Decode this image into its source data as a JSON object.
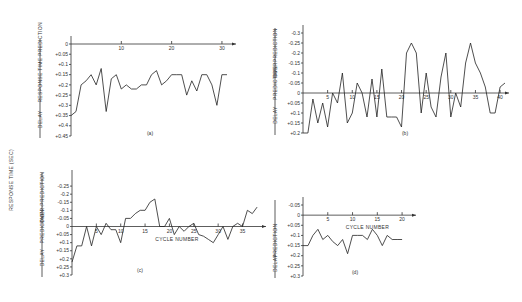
{
  "shared_ylabel": "RESPONSE TIME (SEC)",
  "chart_data": [
    {
      "id": "a",
      "type": "line",
      "caption": "(a)",
      "xlabel": "",
      "ylabel_top": "RESPONSE TIME PREDICTION",
      "ylabel_bottom": "DELAY",
      "xlim": [
        0,
        32
      ],
      "ylim": [
        0,
        0.45
      ],
      "y_inverted": true,
      "x_ticks": [
        10,
        20,
        30
      ],
      "y_ticks": [
        0,
        0.05,
        0.1,
        0.15,
        0.2,
        0.25,
        0.3,
        0.35,
        0.4,
        0.45
      ],
      "y_tick_labels": [
        "0",
        "+0.05",
        "+0.1",
        "+0.15",
        "+0.2",
        "+0.25",
        "+0.3",
        "+0.35",
        "+0.4",
        "+0.45"
      ],
      "x": [
        0,
        1,
        2,
        3,
        4,
        5,
        6,
        7,
        8,
        9,
        10,
        11,
        12,
        13,
        14,
        15,
        16,
        17,
        18,
        19,
        20,
        21,
        22,
        23,
        24,
        25,
        26,
        27,
        28,
        29,
        30,
        31
      ],
      "y": [
        0.35,
        0.33,
        0.2,
        0.18,
        0.15,
        0.2,
        0.12,
        0.33,
        0.17,
        0.15,
        0.22,
        0.2,
        0.22,
        0.22,
        0.2,
        0.2,
        0.15,
        0.13,
        0.2,
        0.18,
        0.15,
        0.15,
        0.15,
        0.25,
        0.18,
        0.23,
        0.15,
        0.15,
        0.2,
        0.3,
        0.15,
        0.15
      ]
    },
    {
      "id": "b",
      "type": "line",
      "caption": "(b)",
      "xlabel": "",
      "ylabel_top": "OVERPREDICTION",
      "ylabel_mid": "PREDICTION",
      "ylabel_bottom": "DELAY",
      "xlim": [
        0,
        41
      ],
      "ylim": [
        -0.3,
        0.2
      ],
      "y_inverted": true,
      "x_ticks": [
        5,
        10,
        15,
        20,
        25,
        30,
        35,
        40
      ],
      "y_ticks": [
        -0.3,
        -0.25,
        -0.2,
        -0.15,
        -0.1,
        -0.05,
        0,
        0.05,
        0.1,
        0.15,
        0.2
      ],
      "y_tick_labels": [
        "-0.3",
        "-0.25",
        "-0.2",
        "-0.15",
        "-0.1",
        "-0.05",
        "0",
        "+0.05",
        "+0.1",
        "+0.15",
        "+0.2"
      ],
      "x": [
        0,
        1,
        2,
        3,
        4,
        5,
        6,
        7,
        8,
        9,
        10,
        11,
        12,
        13,
        14,
        15,
        16,
        17,
        18,
        19,
        20,
        21,
        22,
        23,
        24,
        25,
        26,
        27,
        28,
        29,
        30,
        31,
        32,
        33,
        34,
        35,
        36,
        37,
        38,
        39,
        40,
        41
      ],
      "y": [
        0.2,
        0.2,
        0.03,
        0.15,
        0.05,
        0.17,
        0.0,
        0.05,
        -0.1,
        0.15,
        0.1,
        -0.05,
        0.0,
        0.12,
        -0.07,
        0.12,
        -0.12,
        0.12,
        0.12,
        0.12,
        0.17,
        -0.2,
        -0.25,
        -0.2,
        0.1,
        -0.1,
        0.07,
        0.12,
        -0.08,
        -0.2,
        0.12,
        0.0,
        0.07,
        -0.15,
        -0.25,
        -0.15,
        -0.1,
        -0.03,
        0.1,
        0.1,
        -0.03,
        -0.05
      ]
    },
    {
      "id": "c",
      "type": "line",
      "caption": "(c)",
      "xlabel": "CYCLE NUMBER",
      "ylabel_top": "OVER-PREDICTION",
      "ylabel_mid": "PREDICTION",
      "ylabel_bottom": "DELAY",
      "xlim": [
        0,
        39
      ],
      "ylim": [
        -0.3,
        0.3
      ],
      "y_inverted": true,
      "x_ticks": [
        5,
        10,
        15,
        20,
        25,
        30,
        35
      ],
      "y_ticks": [
        -0.25,
        -0.2,
        -0.15,
        -0.1,
        -0.05,
        0,
        0.05,
        0.1,
        0.15,
        0.2,
        0.25,
        0.3
      ],
      "y_tick_labels": [
        "-0.25",
        "-0.2",
        "-0.15",
        "-0.1",
        "-0.05",
        "0",
        "+0.05",
        "+0.1",
        "+0.15",
        "+0.2",
        "+0.25",
        "+0.3"
      ],
      "x": [
        0,
        1,
        2,
        3,
        4,
        5,
        6,
        7,
        8,
        9,
        10,
        11,
        12,
        13,
        14,
        15,
        16,
        17,
        18,
        19,
        20,
        21,
        22,
        23,
        24,
        25,
        26,
        27,
        28,
        29,
        30,
        31,
        32,
        33,
        34,
        35,
        36,
        37,
        38
      ],
      "y": [
        0.22,
        0.12,
        0.12,
        0.0,
        0.12,
        0.0,
        0.05,
        -0.02,
        0.02,
        0.02,
        0.1,
        -0.05,
        -0.05,
        -0.08,
        -0.1,
        -0.1,
        -0.15,
        -0.17,
        0.0,
        0.0,
        -0.05,
        0.05,
        0.0,
        0.03,
        0.0,
        -0.02,
        0.05,
        0.06,
        0.08,
        0.1,
        0.05,
        0.0,
        0.08,
        0.0,
        -0.02,
        0.0,
        -0.1,
        -0.08,
        -0.12
      ]
    },
    {
      "id": "d",
      "type": "line",
      "caption": "(d)",
      "xlabel": "CYCLE NUMBER",
      "ylabel_mid": "PREDICTION",
      "ylabel_bottom": "DELAY",
      "xlim": [
        0,
        22
      ],
      "ylim": [
        -0.05,
        0.3
      ],
      "y_inverted": true,
      "x_ticks": [
        5,
        10,
        15,
        20
      ],
      "y_ticks": [
        -0.05,
        0,
        0.05,
        0.1,
        0.15,
        0.2,
        0.25,
        0.3
      ],
      "y_tick_labels": [
        "-0.05",
        "0",
        "+0.05",
        "+0.1",
        "+0.15",
        "+0.2",
        "+0.25",
        "+0.3"
      ],
      "x": [
        0,
        1,
        2,
        3,
        4,
        5,
        6,
        7,
        8,
        9,
        10,
        11,
        12,
        13,
        14,
        15,
        16,
        17,
        18,
        19,
        20
      ],
      "y": [
        0.15,
        0.15,
        0.1,
        0.07,
        0.12,
        0.1,
        0.13,
        0.15,
        0.12,
        0.19,
        0.1,
        0.1,
        0.1,
        0.12,
        0.07,
        0.1,
        0.15,
        0.1,
        0.12,
        0.12,
        0.12
      ]
    }
  ]
}
